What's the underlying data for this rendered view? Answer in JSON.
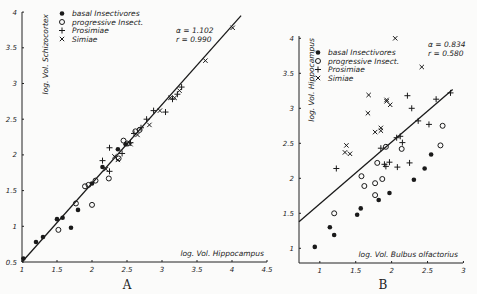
{
  "chart_data": [
    {
      "panel": "A",
      "type": "scatter",
      "xlabel": "log. Vol. Hippocampus",
      "ylabel": "log. Vol. Schizocortex",
      "xlim": [
        1,
        4.5
      ],
      "ylim": [
        0.5,
        4
      ],
      "xticks": [
        "1",
        "1.5",
        "2",
        "2.5",
        "3",
        "3.5",
        "4",
        "4.5"
      ],
      "yticks": [
        "0.5",
        "1",
        "1.5",
        "2",
        "2.5",
        "3",
        "3.5",
        "4"
      ],
      "grid": false,
      "legend_position": "upper-left",
      "annotation": {
        "alpha": "α = 1.102",
        "r": "r = 0.990"
      },
      "regression_line": {
        "x": [
          1.0,
          4.13
        ],
        "y": [
          0.5,
          3.95
        ]
      },
      "series": [
        {
          "name": "basal Insectivores",
          "marker": "filled-circle",
          "points": [
            [
              1.02,
              0.55
            ],
            [
              1.2,
              0.78
            ],
            [
              1.3,
              0.85
            ],
            [
              1.5,
              1.1
            ],
            [
              1.58,
              1.12
            ],
            [
              1.7,
              0.98
            ],
            [
              1.8,
              1.23
            ],
            [
              2.0,
              1.6
            ],
            [
              2.15,
              1.83
            ],
            [
              2.37,
              2.08
            ],
            [
              2.48,
              2.15
            ]
          ]
        },
        {
          "name": "progressive Insect.",
          "marker": "open-circle",
          "points": [
            [
              1.52,
              0.95
            ],
            [
              1.77,
              1.32
            ],
            [
              1.9,
              1.56
            ],
            [
              1.95,
              1.58
            ],
            [
              2.0,
              1.3
            ],
            [
              2.05,
              1.64
            ],
            [
              2.24,
              1.67
            ],
            [
              2.38,
              1.95
            ],
            [
              2.45,
              2.2
            ],
            [
              2.5,
              2.16
            ],
            [
              2.62,
              2.33
            ],
            [
              2.68,
              2.35
            ]
          ]
        },
        {
          "name": "Prosimiae",
          "marker": "plus",
          "points": [
            [
              2.15,
              1.92
            ],
            [
              2.25,
              1.77
            ],
            [
              2.25,
              2.1
            ],
            [
              2.43,
              2.02
            ],
            [
              2.55,
              2.17
            ],
            [
              2.6,
              2.3
            ],
            [
              2.7,
              2.38
            ],
            [
              2.78,
              2.5
            ],
            [
              2.88,
              2.62
            ],
            [
              3.05,
              2.6
            ],
            [
              3.15,
              2.78
            ],
            [
              3.22,
              2.85
            ],
            [
              3.28,
              2.95
            ]
          ]
        },
        {
          "name": "Simiae",
          "marker": "cross",
          "points": [
            [
              2.32,
              1.98
            ],
            [
              2.37,
              1.93
            ],
            [
              2.2,
              1.8
            ],
            [
              2.55,
              2.15
            ],
            [
              2.65,
              2.28
            ],
            [
              2.82,
              2.42
            ],
            [
              2.97,
              2.62
            ],
            [
              3.12,
              2.8
            ],
            [
              3.18,
              2.8
            ],
            [
              3.25,
              2.9
            ],
            [
              3.62,
              3.32
            ],
            [
              4.01,
              3.78
            ]
          ]
        }
      ]
    },
    {
      "panel": "B",
      "type": "scatter",
      "xlabel": "log. Vol. Bulbus olfactorius",
      "ylabel": "log. Vol. Hippocampus",
      "xlim": [
        0.71,
        3.0
      ],
      "ylim": [
        0.79,
        4
      ],
      "xticks": [
        "1",
        "1.5",
        "2",
        "2.5",
        "3"
      ],
      "yticks": [
        "1",
        "1.5",
        "2",
        "2.5",
        "3",
        "3.5",
        "4"
      ],
      "grid": false,
      "legend_position": "upper-left",
      "annotation": {
        "alpha": "α = 0.834",
        "r": "r = 0.580"
      },
      "regression_line": {
        "x": [
          0.71,
          2.85
        ],
        "y": [
          1.38,
          3.27
        ]
      },
      "series": [
        {
          "name": "basal Insectivores",
          "marker": "filled-circle",
          "points": [
            [
              0.93,
              1.02
            ],
            [
              1.14,
              1.3
            ],
            [
              1.2,
              1.19
            ],
            [
              1.52,
              1.48
            ],
            [
              1.57,
              1.57
            ],
            [
              1.82,
              1.69
            ],
            [
              1.97,
              1.79
            ],
            [
              2.31,
              1.98
            ],
            [
              2.46,
              2.14
            ],
            [
              2.55,
              2.34
            ]
          ]
        },
        {
          "name": "progressive Insect.",
          "marker": "open-circle",
          "points": [
            [
              1.2,
              1.5
            ],
            [
              1.58,
              2.03
            ],
            [
              1.62,
              1.89
            ],
            [
              1.77,
              1.93
            ],
            [
              1.77,
              1.76
            ],
            [
              1.8,
              2.22
            ],
            [
              1.87,
              1.99
            ],
            [
              1.92,
              2.45
            ],
            [
              2.14,
              2.42
            ],
            [
              2.68,
              2.47
            ],
            [
              2.71,
              2.75
            ]
          ]
        },
        {
          "name": "Prosimiae",
          "marker": "plus",
          "points": [
            [
              1.23,
              2.14
            ],
            [
              1.85,
              2.43
            ],
            [
              1.9,
              2.2
            ],
            [
              1.92,
              2.17
            ],
            [
              1.97,
              2.23
            ],
            [
              2.08,
              2.16
            ],
            [
              2.15,
              2.51
            ],
            [
              2.25,
              2.22
            ],
            [
              2.07,
              2.58
            ],
            [
              2.12,
              2.6
            ],
            [
              2.22,
              3.18
            ],
            [
              2.28,
              3.0
            ],
            [
              2.37,
              2.82
            ],
            [
              2.52,
              2.77
            ],
            [
              2.62,
              3.13
            ],
            [
              2.82,
              3.22
            ]
          ]
        },
        {
          "name": "Simiae",
          "marker": "cross",
          "points": [
            [
              1.37,
              2.47
            ],
            [
              1.35,
              2.37
            ],
            [
              1.42,
              2.35
            ],
            [
              1.68,
              3.19
            ],
            [
              1.67,
              2.93
            ],
            [
              1.77,
              2.66
            ],
            [
              1.85,
              2.72
            ],
            [
              1.85,
              2.68
            ],
            [
              1.93,
              3.12
            ],
            [
              1.93,
              3.1
            ],
            [
              1.98,
              3.05
            ],
            [
              2.05,
              4.0
            ],
            [
              2.42,
              3.59
            ]
          ]
        }
      ]
    }
  ],
  "panels": {
    "A": {
      "label": "A",
      "legend": [
        "basal Insectivores",
        "progressive Insect.",
        "Prosimiae",
        "Simiae"
      ],
      "stat_alpha": "α = 1.102",
      "stat_r": "r = 0.990",
      "xlabel": "log. Vol. Hippocampus",
      "ylabel": "log. Vol. Schizocortex"
    },
    "B": {
      "label": "B",
      "legend": [
        "basal Insectivores",
        "progressive Insect.",
        "Prosimiae",
        "Simiae"
      ],
      "stat_alpha": "α = 0.834",
      "stat_r": "r = 0.580",
      "xlabel": "log. Vol. Bulbus olfactorius",
      "ylabel": "log. Vol. Hippocampus"
    }
  }
}
